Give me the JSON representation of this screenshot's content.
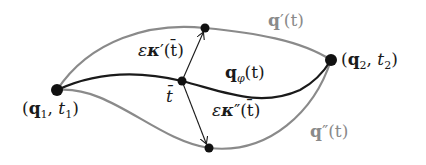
{
  "diagram": {
    "colors": {
      "main_curve": "#1a1a1a",
      "variation_curves": "#8a8a8a",
      "points": "#111111",
      "background": "#ffffff"
    },
    "points": {
      "start": {
        "x": 57,
        "y": 90,
        "label": "(q1, t1)"
      },
      "end": {
        "x": 331,
        "y": 60,
        "label": "(q2, t2)"
      },
      "mid": {
        "x": 182,
        "y": 81,
        "label": "t̄"
      },
      "upper": {
        "x": 205,
        "y": 28
      },
      "lower": {
        "x": 209,
        "y": 148
      }
    },
    "curves": [
      {
        "name": "q_phi",
        "label": "qφ(t)",
        "color": "#1a1a1a"
      },
      {
        "name": "q_prime",
        "label": "q′(t)",
        "color": "#8a8a8a"
      },
      {
        "name": "q_double_prime",
        "label": "q″(t)",
        "color": "#8a8a8a"
      }
    ],
    "arrows": [
      {
        "name": "kappa_prime",
        "label": "εκ′(t̄)"
      },
      {
        "name": "kappa_double_prime",
        "label": "εκ″(t̄)"
      }
    ],
    "labels": {
      "start_open": "(",
      "start_q": "q",
      "start_q_sub": "1",
      "start_comma": ", ",
      "start_t": "t",
      "start_t_sub": "1",
      "start_close": ")",
      "end_open": "(",
      "end_q": "q",
      "end_q_sub": "2",
      "end_comma": ", ",
      "end_t": "t",
      "end_t_sub": "2",
      "end_close": ")",
      "mid_t": "t̄",
      "qphi_q": "q",
      "qphi_sub": "φ",
      "qphi_rest": "(t)",
      "qprime_q": "q",
      "qprime_rest": "′(t)",
      "qdprime_q": "q",
      "qdprime_rest": "″(t)",
      "kprime_eps": "ε",
      "kprime_kappa": "κ",
      "kprime_rest": "′(t̄)",
      "kdprime_eps": "ε",
      "kdprime_kappa": "κ",
      "kdprime_rest": "″(t̄)"
    }
  }
}
